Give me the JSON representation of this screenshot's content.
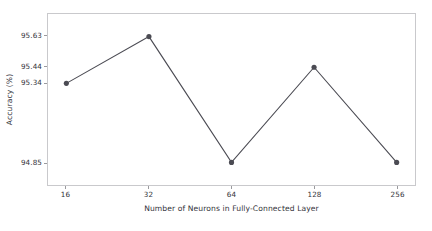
{
  "chart_data": {
    "type": "line",
    "title": "",
    "xlabel": "Number of Neurons in Fully-Connected Layer",
    "ylabel": "Accuracy (%)",
    "categories": [
      "16",
      "32",
      "64",
      "128",
      "256"
    ],
    "values": [
      95.34,
      95.63,
      94.85,
      95.44,
      94.85
    ],
    "series": [
      {
        "name": "Accuracy",
        "values": [
          95.34,
          95.63,
          94.85,
          95.44,
          94.85
        ]
      }
    ],
    "xtick_labels": [
      "16",
      "32",
      "64",
      "128",
      "256"
    ],
    "ytick_labels": [
      "94.85",
      "95.34",
      "95.44",
      "95.63"
    ],
    "ytick_values": [
      94.85,
      95.34,
      95.44,
      95.63
    ],
    "ylim": [
      94.71,
      95.77
    ],
    "grid": false,
    "legend": false,
    "legend_position": "none",
    "marker": "circle",
    "line_color": "#4b4b53",
    "marker_color": "#4b4b53",
    "axes_color": "#c9c9cc",
    "background_color": "#ffffff",
    "text_color": "#33333a"
  }
}
